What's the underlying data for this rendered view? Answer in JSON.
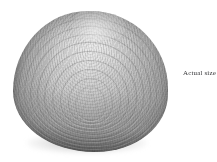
{
  "page": {
    "background_color": "#ffffff",
    "width": 217,
    "height": 162
  },
  "figure": {
    "subject_name": "clam-shell-specimen",
    "subject_description": "Grayscale photograph of a bivalve clam shell, exterior view, showing concentric growth rings",
    "placement": "left",
    "colors": {
      "shell_light": "#d6d6d6",
      "shell_mid": "#aaaaaa",
      "shell_dark": "#6f6f6f",
      "shell_rim": "#3f3f3f",
      "shadow": "#8e8e8e"
    },
    "growth_rings": [
      {
        "inset_x": 5,
        "inset_y": 7,
        "width": 0.6,
        "opacity": 0.22
      },
      {
        "inset_x": 11,
        "inset_y": 15,
        "width": 0.6,
        "opacity": 0.24
      },
      {
        "inset_x": 17,
        "inset_y": 23,
        "width": 0.7,
        "opacity": 0.26
      },
      {
        "inset_x": 24,
        "inset_y": 31,
        "width": 0.7,
        "opacity": 0.27
      },
      {
        "inset_x": 31,
        "inset_y": 40,
        "width": 0.8,
        "opacity": 0.28
      },
      {
        "inset_x": 39,
        "inset_y": 49,
        "width": 0.8,
        "opacity": 0.26
      },
      {
        "inset_x": 47,
        "inset_y": 58,
        "width": 0.8,
        "opacity": 0.24
      },
      {
        "inset_x": 55,
        "inset_y": 67,
        "width": 0.7,
        "opacity": 0.2
      },
      {
        "inset_x": 62,
        "inset_y": 75,
        "width": 0.6,
        "opacity": 0.16
      }
    ]
  },
  "caption": {
    "text": "Actual size"
  }
}
